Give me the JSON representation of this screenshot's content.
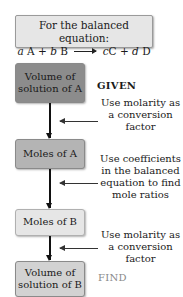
{
  "header": {
    "title": "For the balanced equation:",
    "equation": {
      "lhs": [
        {
          "coef": "a",
          "species": "A"
        },
        {
          "coef": "b",
          "species": "B"
        }
      ],
      "rhs": [
        {
          "coef": "c",
          "species": "C"
        },
        {
          "coef": "d",
          "species": "D"
        }
      ],
      "plus": "+"
    }
  },
  "nodes": [
    {
      "line1": "Volume of",
      "line2": "solution of A",
      "color": "#8c8c8c"
    },
    {
      "line1": "Moles of A",
      "line2": "",
      "color": "#b4b4b4"
    },
    {
      "line1": "Moles of B",
      "line2": "",
      "color": "#e6e6e6"
    },
    {
      "line1": "Volume of",
      "line2": "solution of B",
      "color": "#d2d2d2"
    }
  ],
  "steps": [
    {
      "lines": [
        "Use molarity as",
        "a conversion",
        "factor"
      ]
    },
    {
      "lines": [
        "Use coefficients",
        "in the balanced",
        "equation to find",
        "mole ratios"
      ]
    },
    {
      "lines": [
        "Use molarity as",
        "a conversion",
        "factor"
      ]
    }
  ],
  "labels": {
    "given": "GIVEN",
    "find": "FIND"
  }
}
